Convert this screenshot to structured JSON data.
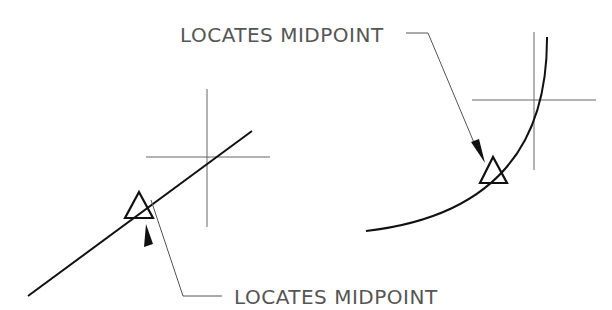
{
  "diagram": {
    "colors": {
      "geometry": "#111111",
      "crosshair": "#666666",
      "leader": "#555555",
      "text": "#555555",
      "background": "#ffffff"
    },
    "callouts": [
      {
        "id": "arc-midpoint",
        "label": "LOCATES MIDPOINT",
        "target": "arc"
      },
      {
        "id": "line-midpoint",
        "label": "LOCATES MIDPOINT",
        "target": "line"
      }
    ],
    "figures": [
      {
        "id": "line",
        "shape": "line",
        "marker": "triangle",
        "marker_meaning": "midpoint-snap"
      },
      {
        "id": "arc",
        "shape": "arc",
        "marker": "triangle",
        "marker_meaning": "midpoint-snap"
      }
    ]
  }
}
